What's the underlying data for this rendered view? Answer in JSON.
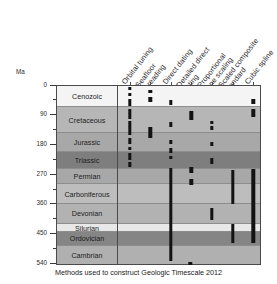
{
  "caption": "Methods used to construct Geologic Timescale 2012",
  "axis": {
    "unit_label": "Ma",
    "ticks": [
      {
        "value": 0,
        "label": "0",
        "major": true
      },
      {
        "value": 45,
        "label": "",
        "major": false
      },
      {
        "value": 90,
        "label": "90",
        "major": true
      },
      {
        "value": 135,
        "label": "",
        "major": false
      },
      {
        "value": 180,
        "label": "180",
        "major": true
      },
      {
        "value": 225,
        "label": "",
        "major": false
      },
      {
        "value": 270,
        "label": "270",
        "major": true
      },
      {
        "value": 315,
        "label": "",
        "major": false
      },
      {
        "value": 360,
        "label": "360",
        "major": true
      },
      {
        "value": 405,
        "label": "",
        "major": false
      },
      {
        "value": 450,
        "label": "450",
        "major": true
      },
      {
        "value": 495,
        "label": "",
        "major": false
      },
      {
        "value": 540,
        "label": "540",
        "major": true
      }
    ],
    "range": [
      0,
      545
    ]
  },
  "columns": [
    {
      "label": "Orbital tuning"
    },
    {
      "label": "Seafloor\nspreading"
    },
    {
      "label": "Direct dating"
    },
    {
      "label": "Detailed direct\ndating"
    },
    {
      "label": "Proportional\nzone scaling"
    },
    {
      "label": "Scaled composite\nstandard"
    },
    {
      "label": "Cubic spline"
    }
  ],
  "periods": [
    {
      "name": "Cenozoic",
      "start": 0,
      "end": 66,
      "color": "#f4f4f4"
    },
    {
      "name": "Cretaceous",
      "start": 66,
      "end": 145,
      "color": "#b6b6b6"
    },
    {
      "name": "Jurassic",
      "start": 145,
      "end": 201,
      "color": "#a8a8a8"
    },
    {
      "name": "Triassic",
      "start": 201,
      "end": 252,
      "color": "#7e7e7e"
    },
    {
      "name": "Permian",
      "start": 252,
      "end": 299,
      "color": "#a8a8a8"
    },
    {
      "name": "Carboniferous",
      "start": 299,
      "end": 359,
      "color": "#bdbdbd"
    },
    {
      "name": "Devonian",
      "start": 359,
      "end": 419,
      "color": "#b2b2b2"
    },
    {
      "name": "Silurian",
      "start": 419,
      "end": 444,
      "color": "#e8e8e8"
    },
    {
      "name": "Ordovician",
      "start": 444,
      "end": 485,
      "color": "#858585"
    },
    {
      "name": "Cambrian",
      "start": 485,
      "end": 541,
      "color": "#b0b0b0"
    }
  ],
  "chart_data": {
    "type": "bar",
    "title": "Methods used to construct Geologic Timescale 2012",
    "xlabel": "",
    "ylabel": "Ma",
    "ylim": [
      0,
      545
    ],
    "grid": true,
    "legend": "none",
    "orientation": "vertical-time-axis",
    "categories": [
      "Orbital tuning",
      "Seafloor spreading",
      "Direct dating",
      "Detailed direct dating",
      "Proportional zone scaling",
      "Scaled composite standard",
      "Cubic spline"
    ],
    "series": [
      {
        "name": "Orbital tuning",
        "intervals": [
          [
            4,
            14
          ],
          [
            22,
            32
          ],
          [
            40,
            62
          ],
          [
            70,
            100
          ],
          [
            108,
            150
          ],
          [
            160,
            178
          ],
          [
            186,
            196
          ],
          [
            205,
            225
          ],
          [
            232,
            246
          ]
        ]
      },
      {
        "name": "Seafloor spreading",
        "intervals": [
          [
            14,
            24
          ],
          [
            34,
            50
          ],
          [
            126,
            160
          ]
        ]
      },
      {
        "name": "Direct dating",
        "intervals": [
          [
            44,
            58
          ],
          [
            112,
            126
          ],
          [
            164,
            176
          ],
          [
            190,
            204
          ],
          [
            212,
            222
          ],
          [
            250,
            532
          ]
        ]
      },
      {
        "name": "Detailed direct dating",
        "intervals": [
          [
            78,
            104
          ],
          [
            248,
            266
          ],
          [
            284,
            302
          ]
        ]
      },
      {
        "name": "Proportional zone scaling",
        "intervals": [
          [
            106,
            118
          ],
          [
            124,
            134
          ],
          [
            170,
            184
          ],
          [
            218,
            238
          ],
          [
            372,
            408
          ]
        ]
      },
      {
        "name": "Scaled composite standard",
        "intervals": [
          [
            256,
            358
          ],
          [
            420,
            478
          ]
        ]
      },
      {
        "name": "Cubic spline",
        "intervals": [
          [
            40,
            56
          ],
          [
            72,
            96
          ],
          [
            254,
            478
          ]
        ]
      }
    ],
    "period_bands": [
      {
        "name": "Cenozoic",
        "start": 0,
        "end": 66
      },
      {
        "name": "Cretaceous",
        "start": 66,
        "end": 145
      },
      {
        "name": "Jurassic",
        "start": 145,
        "end": 201
      },
      {
        "name": "Triassic",
        "start": 201,
        "end": 252
      },
      {
        "name": "Permian",
        "start": 252,
        "end": 299
      },
      {
        "name": "Carboniferous",
        "start": 299,
        "end": 359
      },
      {
        "name": "Devonian",
        "start": 359,
        "end": 419
      },
      {
        "name": "Silurian",
        "start": 419,
        "end": 444
      },
      {
        "name": "Ordovician",
        "start": 444,
        "end": 485
      },
      {
        "name": "Cambrian",
        "start": 485,
        "end": 541
      }
    ],
    "extra_marks": [
      {
        "series": "Detailed direct dating",
        "start": 538,
        "end": 548,
        "note": "below plot frame"
      }
    ]
  }
}
